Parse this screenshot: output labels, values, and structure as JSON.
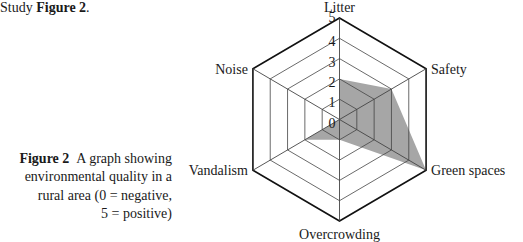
{
  "intro": {
    "prefix": "Study ",
    "bold": "Figure 2",
    "suffix": "."
  },
  "caption": {
    "label": "Figure 2",
    "text_lines": [
      "A graph showing",
      "environmental quality in a",
      "rural area (0 = negative,",
      "5 = positive)"
    ]
  },
  "colors": {
    "fill": "#a6a6a6",
    "grid": "#444444",
    "outer": "#111111",
    "text": "#1a1a1a"
  },
  "chart_data": {
    "type": "radar",
    "title": "A graph showing environmental quality in a rural area (0 = negative, 5 = positive)",
    "categories": [
      "Litter",
      "Safety",
      "Green spaces",
      "Overcrowding",
      "Vandalism",
      "Noise"
    ],
    "values": [
      2,
      3,
      5,
      1,
      2,
      0
    ],
    "scale_ticks": [
      "0",
      "1",
      "2",
      "3",
      "4",
      "5"
    ],
    "range": [
      0,
      5
    ],
    "grid": true,
    "legend": "none"
  }
}
